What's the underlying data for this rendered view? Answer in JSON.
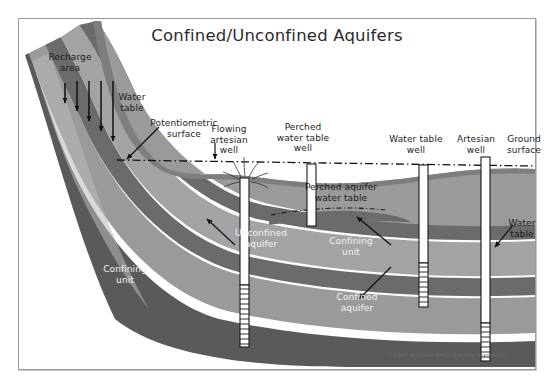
{
  "figure": {
    "title": "Confined/Unconfined Aquifers",
    "copyright": "©2007 National Ground Water Association"
  },
  "labels": {
    "recharge_area": "Recharge\narea",
    "water_table_left": "Water\ntable",
    "potentiometric_surface": "Potentiometric\nsurface",
    "flowing_artesian_well": "Flowing\nartesian\nwell",
    "perched_water_table_well": "Perched\nwater table\nwell",
    "perched_aquifer_water_table": "Perched aquifer\nwater table",
    "water_table_well": "Water table\nwell",
    "artesian_well": "Artesian\nwell",
    "ground_surface": "Ground\nsurface",
    "water_table_right": "Water\ntable",
    "unconfined_aquifer": "Unconfined\naquifer",
    "confining_unit_center": "Confining\nunit",
    "confined_aquifer": "Confined\naquifer",
    "confining_unit_left": "Confining\nunit"
  },
  "colors": {
    "background": "#ffffff",
    "frame_border": "#9a9a9a",
    "title_text": "#2b2b2b",
    "label_dark": "#1c1c1c",
    "label_light": "#f2f2f2",
    "aquifer_light": "#b9b9b9",
    "aquifer_mid": "#a3a3a3",
    "aquifer_body": "#9a9a9a",
    "confining_unit": "#6b6b6b",
    "confining_unit_dark": "#5a5a5a",
    "surface_soil": "#8d8d8d",
    "well_casing": "#ffffff",
    "well_outline": "#1a1a1a",
    "potentiometric_line": "#111111",
    "arrow": "#111111",
    "copyright_text": "#6e6e6e"
  },
  "geology": {
    "description": "Cross-section of layered aquifer system dipping from upper-left to lower-right",
    "layers": [
      {
        "name": "ground-surface-soil",
        "fill": "#8d8d8d"
      },
      {
        "name": "unconfined-aquifer",
        "fill": "#9a9a9a"
      },
      {
        "name": "confining-unit-upper",
        "fill": "#6b6b6b"
      },
      {
        "name": "confined-aquifer-upper",
        "fill": "#a3a3a3"
      },
      {
        "name": "confining-unit-lower",
        "fill": "#6b6b6b"
      },
      {
        "name": "confined-aquifer-lower",
        "fill": "#9a9a9a"
      },
      {
        "name": "confining-unit-basal",
        "fill": "#5a5a5a"
      }
    ]
  },
  "wells": [
    {
      "id": "flowing-artesian-well",
      "flowing": true,
      "screened": true
    },
    {
      "id": "perched-water-table-well",
      "flowing": false,
      "screened": false
    },
    {
      "id": "water-table-well",
      "flowing": false,
      "screened": true
    },
    {
      "id": "artesian-well",
      "flowing": false,
      "screened": true
    }
  ],
  "recharge_arrow_count": 5
}
